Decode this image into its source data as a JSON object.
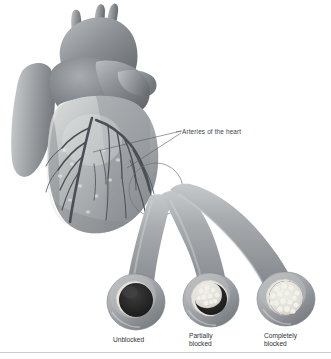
{
  "figure": {
    "title": "Arteries of the heart",
    "style": "grayscale medical illustration",
    "background_color": "#ffffff",
    "width": 331,
    "height": 359
  },
  "callout": {
    "label": "Arteries of the heart",
    "leader_line_color": "#555a60",
    "magnifier_circle_color": "#6e7378"
  },
  "anatomy": {
    "aorta_label": "aorta",
    "pulmonary_trunk_label": "pulmonary trunk",
    "epicardial_fat_label": "epicardial fat",
    "ventricle_label": "ventricle",
    "coronary_artery_label": "coronary artery",
    "muscle_color": "#9a9ea2",
    "muscle_shadow_color": "#6b7074",
    "muscle_highlight_color": "#c9ccce",
    "fat_color": "#eceae4",
    "artery_color": "#4a4f55"
  },
  "vessels": [
    {
      "id": "unblocked",
      "caption": "Unblocked",
      "state": "open lumen",
      "occlusion_percent": 0,
      "lumen_color": "#2b2b2b",
      "wall_color": "#9b9fa3",
      "plaque_color": "#e8e6df"
    },
    {
      "id": "partially-blocked",
      "caption": "Partially\nblocked",
      "state": "plaque narrows lumen",
      "occlusion_percent": 55,
      "lumen_color": "#2b2b2b",
      "wall_color": "#9b9fa3",
      "plaque_color": "#e8e6df"
    },
    {
      "id": "completely-blocked",
      "caption": "Completely\nblocked",
      "state": "plaque fills lumen",
      "occlusion_percent": 100,
      "lumen_color": "#2b2b2b",
      "wall_color": "#9b9fa3",
      "plaque_color": "#e8e6df"
    }
  ],
  "divider": {
    "color": "#c9ccd0"
  }
}
